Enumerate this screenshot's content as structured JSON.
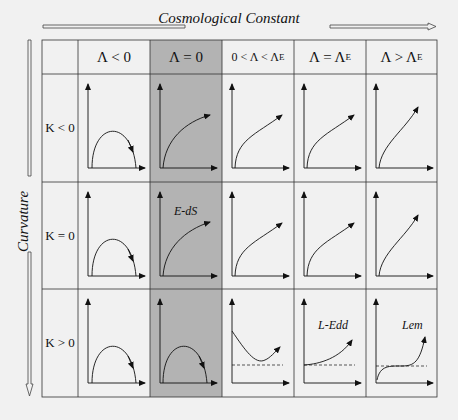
{
  "axes": {
    "horizontal_label": "Cosmological Constant",
    "vertical_label": "Curvature"
  },
  "columns": [
    {
      "label": "Λ < 0",
      "shaded": false
    },
    {
      "label": "Λ = 0",
      "shaded": true
    },
    {
      "label": "0 < Λ < Λ",
      "sub": "E",
      "shaded": false
    },
    {
      "label": "Λ = Λ",
      "sub": "E",
      "shaded": false
    },
    {
      "label": "Λ > Λ",
      "sub": "E",
      "shaded": false
    }
  ],
  "rows": [
    {
      "label": "K < 0"
    },
    {
      "label": "K = 0"
    },
    {
      "label": "K > 0"
    }
  ],
  "annotations": {
    "eds": "E-dS",
    "ledd": "L-Edd",
    "lem": "Lem"
  },
  "colors": {
    "background": "#f1f1f1",
    "shaded_column": "#b3b3b3",
    "lines": "#333333"
  }
}
